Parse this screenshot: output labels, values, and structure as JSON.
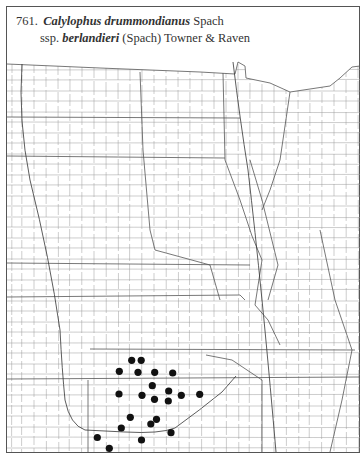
{
  "caption": {
    "number": "761.",
    "genus_species": "Calylophus drummondianus",
    "author1": "Spach",
    "ssp_prefix": "ssp.",
    "subspecies": "berlandieri",
    "author2": "(Spach) Towner & Raven"
  },
  "map": {
    "type": "county dot distribution map",
    "region": "Great Plains (North Dakota to Oklahoma, with adjacent states)",
    "dot_color": "#111111",
    "line_color": "#666666",
    "occurrence_points": [
      {
        "x": 131.7,
        "y": 360.3
      },
      {
        "x": 141.2,
        "y": 360.3
      },
      {
        "x": 119.3,
        "y": 371.3
      },
      {
        "x": 138.0,
        "y": 372.3
      },
      {
        "x": 154.7,
        "y": 372.3
      },
      {
        "x": 172.7,
        "y": 373.0
      },
      {
        "x": 152.3,
        "y": 385.7
      },
      {
        "x": 168.7,
        "y": 391.0
      },
      {
        "x": 119.0,
        "y": 394.0
      },
      {
        "x": 142.0,
        "y": 395.3
      },
      {
        "x": 181.3,
        "y": 395.3
      },
      {
        "x": 199.7,
        "y": 394.3
      },
      {
        "x": 154.5,
        "y": 399.3
      },
      {
        "x": 168.3,
        "y": 401.0
      },
      {
        "x": 130.3,
        "y": 417.3
      },
      {
        "x": 156.5,
        "y": 419.3
      },
      {
        "x": 150.8,
        "y": 424.0
      },
      {
        "x": 121.3,
        "y": 428.0
      },
      {
        "x": 171.0,
        "y": 432.7
      },
      {
        "x": 97.3,
        "y": 437.5
      },
      {
        "x": 141.5,
        "y": 440.0
      },
      {
        "x": 109.3,
        "y": 448.3
      }
    ]
  }
}
